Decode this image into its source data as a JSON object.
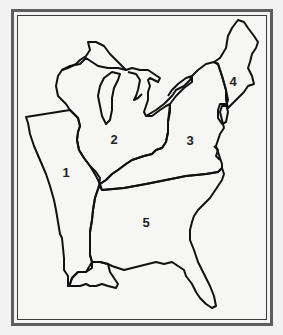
{
  "map": {
    "type": "outline-map",
    "subject": "Eastern United States regions",
    "regions": [
      {
        "id": "1",
        "label": "1"
      },
      {
        "id": "2",
        "label": "2"
      },
      {
        "id": "3",
        "label": "3"
      },
      {
        "id": "4",
        "label": "4"
      },
      {
        "id": "5",
        "label": "5"
      }
    ],
    "colors": {
      "outline": "#111111",
      "background": "#f6f6f5",
      "frame": "#5e5e5e"
    }
  }
}
